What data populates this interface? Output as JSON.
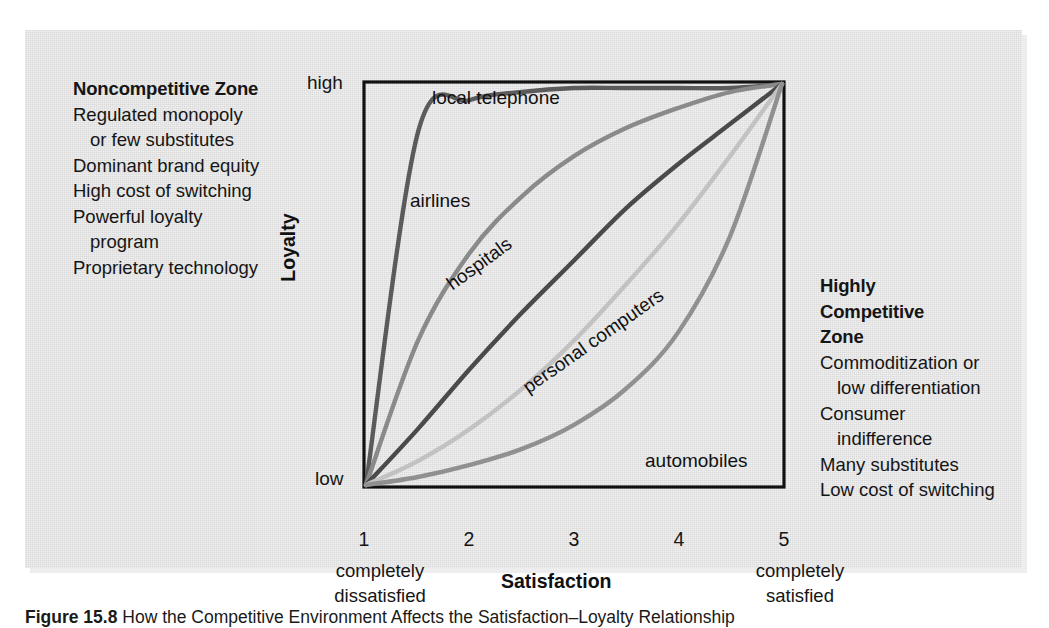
{
  "figure": {
    "caption_number": "Figure 15.8",
    "caption_text": " How the Competitive Environment Affects the Satisfaction–Loyalty Relationship",
    "panel_background": "#e2e2e2",
    "page_background": "#ffffff"
  },
  "left_panel": {
    "heading": "Noncompetitive Zone",
    "lines": [
      {
        "text": "Regulated monopoly",
        "indent": false
      },
      {
        "text": "or few substitutes",
        "indent": true
      },
      {
        "text": "Dominant brand equity",
        "indent": false
      },
      {
        "text": "High cost of switching",
        "indent": false
      },
      {
        "text": "Powerful loyalty",
        "indent": false
      },
      {
        "text": "program",
        "indent": true
      },
      {
        "text": "Proprietary technology",
        "indent": false
      }
    ]
  },
  "right_panel": {
    "heading_lines": [
      "Highly",
      "Competitive",
      "Zone"
    ],
    "lines": [
      {
        "text": "Commoditization or",
        "indent": false
      },
      {
        "text": "low differentiation",
        "indent": true
      },
      {
        "text": "Consumer",
        "indent": false
      },
      {
        "text": "indifference",
        "indent": true
      },
      {
        "text": "Many substitutes",
        "indent": false
      },
      {
        "text": "Low cost of switching",
        "indent": false
      }
    ]
  },
  "chart_data": {
    "type": "line",
    "xlabel": "Satisfaction",
    "ylabel": "Loyalty",
    "xlim": [
      1,
      5
    ],
    "ylim": [
      0,
      100
    ],
    "grid": false,
    "legend": "inline-curve-labels",
    "x_ticks": [
      "1",
      "2",
      "3",
      "4",
      "5"
    ],
    "x_tick_notes": {
      "left": [
        "completely",
        "dissatisfied"
      ],
      "right": [
        "completely",
        "satisfied"
      ]
    },
    "y_ticks": [
      "low",
      "high"
    ],
    "y_tick_positions": [
      0,
      100
    ],
    "x": [
      1,
      1.5,
      2,
      2.5,
      3,
      3.5,
      4,
      4.5,
      5
    ],
    "series": [
      {
        "name": "local telephone",
        "color": "#5b5b5b",
        "shape": "steep-saturating",
        "values": [
          0,
          88,
          96,
          98,
          99,
          99,
          99,
          99,
          100
        ]
      },
      {
        "name": "airlines",
        "color": "#8a8a8a",
        "shape": "concave-down",
        "values": [
          0,
          36,
          58,
          72,
          82,
          89,
          94,
          98,
          100
        ]
      },
      {
        "name": "hospitals",
        "color": "#4a4a4a",
        "shape": "near-linear",
        "values": [
          0,
          14,
          29,
          43,
          56,
          69,
          80,
          90,
          100
        ]
      },
      {
        "name": "personal computers",
        "color": "#c2c2c2",
        "shape": "concave-up-mild",
        "values": [
          0,
          6,
          14,
          24,
          36,
          50,
          65,
          82,
          100
        ]
      },
      {
        "name": "automobiles",
        "color": "#909090",
        "shape": "convex-late-rise",
        "values": [
          0,
          2,
          5,
          9,
          15,
          24,
          38,
          62,
          100
        ]
      }
    ]
  },
  "axis_labels": {
    "y_high": "high",
    "y_low": "low",
    "y_title": "Loyalty",
    "x_title": "Satisfaction"
  }
}
